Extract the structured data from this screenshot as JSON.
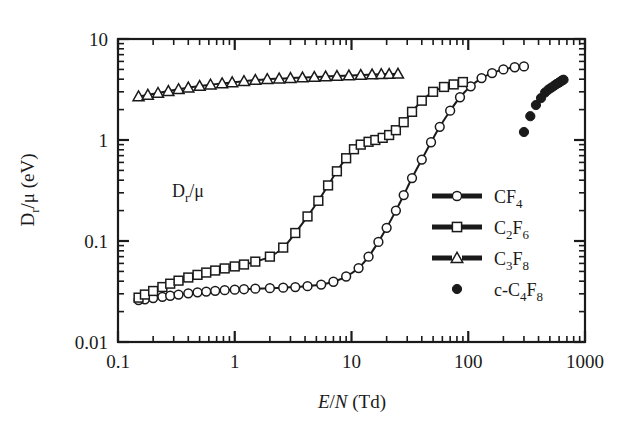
{
  "figure": {
    "background": "#ffffff",
    "ink": "#1a1a1a",
    "annotation": {
      "main": "D",
      "sub": "r",
      "tail": "/μ"
    }
  },
  "axes": {
    "x": {
      "label_parts": {
        "e": "E",
        "slash": "/",
        "n": "N",
        "unit": " (Td)"
      },
      "label": "E/N (Td)",
      "scale": "log",
      "min": 0.1,
      "max": 1000,
      "ticks": [
        "0.1",
        "1",
        "10",
        "100",
        "1000"
      ],
      "tick_values": [
        0.1,
        1,
        10,
        100,
        1000
      ]
    },
    "y": {
      "label_parts": {
        "main": "D",
        "sub": "r",
        "tail": "/μ (eV)"
      },
      "label": "Dr/μ (eV)",
      "scale": "log",
      "min": 0.01,
      "max": 10,
      "ticks": [
        "0.01",
        "0.1",
        "1",
        "10"
      ],
      "tick_values": [
        0.01,
        0.1,
        1,
        10
      ]
    }
  },
  "legend": {
    "position": "right-middle",
    "items": [
      {
        "marker": "circle-open",
        "line": true,
        "base": "CF",
        "sub": "4",
        "prefix": "",
        "label": "CF4"
      },
      {
        "marker": "square-open",
        "line": true,
        "base": "C",
        "sub": "2",
        "base2": "F",
        "sub2": "6",
        "prefix": "",
        "label": "C2F6"
      },
      {
        "marker": "triangle-open",
        "line": true,
        "base": "C",
        "sub": "3",
        "base2": "F",
        "sub2": "8",
        "prefix": "",
        "label": "C3F8"
      },
      {
        "marker": "circle-filled",
        "line": false,
        "prefix": "c-",
        "base": "C",
        "sub": "4",
        "base2": "F",
        "sub2": "8",
        "label": "c-C4F8"
      }
    ]
  },
  "chart_data": {
    "type": "line",
    "title": "",
    "xlabel": "E/N (Td)",
    "ylabel": "Dr/μ (eV)",
    "xscale": "log",
    "yscale": "log",
    "xlim": [
      0.1,
      1000
    ],
    "ylim": [
      0.01,
      10
    ],
    "grid": false,
    "legend_position": "right-middle",
    "annotations": [
      {
        "text": "Dr/μ",
        "x": 0.7,
        "y": 0.33
      }
    ],
    "series": [
      {
        "name": "CF4",
        "marker": "circle-open",
        "line": true,
        "x": [
          0.15,
          0.17,
          0.2,
          0.24,
          0.28,
          0.33,
          0.4,
          0.48,
          0.57,
          0.68,
          0.82,
          1.0,
          1.2,
          1.5,
          2.0,
          2.6,
          3.3,
          4.2,
          5.5,
          7.0,
          9.0,
          11.5,
          14.0,
          17.0,
          20.0,
          24.0,
          28.0,
          33.0,
          40.0,
          48.0,
          57.0,
          70.0,
          85.0,
          105.0,
          130.0,
          160.0,
          200.0,
          250.0,
          300.0
        ],
        "y": [
          0.026,
          0.0265,
          0.0272,
          0.028,
          0.0287,
          0.0295,
          0.0303,
          0.031,
          0.0316,
          0.0321,
          0.0326,
          0.033,
          0.0333,
          0.0337,
          0.0341,
          0.0345,
          0.035,
          0.0357,
          0.037,
          0.0395,
          0.0445,
          0.054,
          0.07,
          0.098,
          0.135,
          0.2,
          0.285,
          0.42,
          0.64,
          0.95,
          1.35,
          1.95,
          2.65,
          3.4,
          4.1,
          4.6,
          5.0,
          5.25,
          5.35
        ]
      },
      {
        "name": "C2F6",
        "marker": "square-open",
        "line": true,
        "x": [
          0.15,
          0.17,
          0.2,
          0.24,
          0.28,
          0.33,
          0.4,
          0.48,
          0.57,
          0.68,
          0.82,
          1.0,
          1.2,
          1.5,
          2.0,
          2.6,
          3.3,
          4.2,
          5.2,
          6.3,
          7.5,
          9.0,
          10.5,
          12.0,
          14.0,
          16.0,
          18.5,
          21.0,
          24.0,
          28.0,
          33.0,
          40.0,
          50.0,
          62.0,
          75.0,
          90.0
        ],
        "y": [
          0.0275,
          0.0295,
          0.032,
          0.035,
          0.0378,
          0.0405,
          0.0435,
          0.0462,
          0.0487,
          0.051,
          0.0535,
          0.056,
          0.0585,
          0.0625,
          0.07,
          0.086,
          0.12,
          0.175,
          0.25,
          0.355,
          0.49,
          0.66,
          0.81,
          0.9,
          0.96,
          1.0,
          1.05,
          1.12,
          1.25,
          1.5,
          1.9,
          2.45,
          3.0,
          3.35,
          3.55,
          3.75
        ]
      },
      {
        "name": "C3F8",
        "marker": "triangle-open",
        "line": true,
        "x": [
          0.15,
          0.18,
          0.22,
          0.27,
          0.33,
          0.4,
          0.5,
          0.62,
          0.78,
          0.95,
          1.2,
          1.5,
          1.9,
          2.4,
          3.0,
          3.8,
          4.8,
          6.0,
          7.5,
          9.5,
          12.0,
          15.0,
          18.0,
          21.0,
          25.0
        ],
        "y": [
          2.7,
          2.8,
          2.92,
          3.05,
          3.18,
          3.3,
          3.42,
          3.53,
          3.63,
          3.72,
          3.82,
          3.92,
          4.0,
          4.05,
          4.1,
          4.15,
          4.2,
          4.25,
          4.3,
          4.35,
          4.4,
          4.45,
          4.48,
          4.5,
          4.52
        ]
      },
      {
        "name": "c-C4F8",
        "marker": "circle-filled",
        "line": false,
        "x": [
          300,
          340,
          380,
          420,
          455,
          485,
          515,
          545,
          570,
          595,
          615,
          635,
          655
        ],
        "y": [
          1.2,
          1.72,
          2.22,
          2.6,
          2.95,
          3.15,
          3.3,
          3.45,
          3.58,
          3.68,
          3.78,
          3.88,
          3.95
        ]
      }
    ]
  }
}
